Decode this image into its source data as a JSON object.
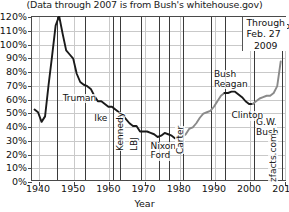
{
  "caption": "(Data through 2007 is from Bush's whitehouse.gov)",
  "watermark": "zfacts.com",
  "through_note": {
    "line1": "Through",
    "line2": "Feb. 27",
    "line3": "2009"
  },
  "chart_data": {
    "type": "line",
    "title": "",
    "subtitle": "(Data through 2007 is from Bush's whitehouse.gov)",
    "xlabel": "Year",
    "ylabel": "",
    "xlim": [
      1938,
      2010.5
    ],
    "ylim": [
      0,
      120
    ],
    "grid": true,
    "legend": "none",
    "ytick_labels": [
      "0%",
      "10%",
      "20%",
      "30%",
      "40%",
      "50%",
      "60%",
      "70%",
      "80%",
      "90%",
      "100%",
      "110%",
      "120%"
    ],
    "ytick_values": [
      0,
      10,
      20,
      30,
      40,
      50,
      60,
      70,
      80,
      90,
      100,
      110,
      120
    ],
    "xtick_labels": [
      "1940",
      "1950",
      "1960",
      "1970",
      "1980",
      "1990",
      "2000",
      "2010"
    ],
    "xtick_values": [
      1940,
      1950,
      1960,
      1970,
      1980,
      1990,
      2000,
      2010
    ],
    "series": [
      {
        "name": "Gross federal debt as percent of GDP",
        "color": "#1a1a1a",
        "x": [
          1939,
          1940,
          1941,
          1942,
          1943,
          1944,
          1945,
          1946,
          1947,
          1948,
          1949,
          1950,
          1951,
          1952,
          1953,
          1954,
          1955,
          1956,
          1957,
          1958,
          1959,
          1960,
          1961,
          1962,
          1963,
          1964,
          1965,
          1966,
          1967,
          1968,
          1969,
          1970,
          1971,
          1972,
          1973,
          1974,
          1975,
          1976,
          1977,
          1978,
          1979,
          1980,
          1981,
          1982,
          1983,
          1984,
          1985,
          1986,
          1987,
          1988,
          1989,
          1990,
          1991,
          1992,
          1993,
          1994,
          1995,
          1996,
          1997,
          1998,
          1999,
          2000,
          2001,
          2002,
          2003,
          2004,
          2005,
          2006,
          2007,
          2008,
          2009
        ],
        "values": [
          52,
          50,
          43,
          47,
          70,
          91,
          113,
          120,
          107,
          95,
          92,
          89,
          78,
          72,
          70,
          69,
          67,
          62,
          58,
          58,
          56,
          54,
          54,
          52,
          50,
          48,
          45,
          42,
          40,
          40,
          36,
          36,
          36,
          35,
          34,
          32,
          33,
          35,
          34,
          33,
          31,
          32,
          32,
          34,
          38,
          39,
          42,
          46,
          49,
          50,
          51,
          54,
          58,
          62,
          64,
          64,
          65,
          65,
          63,
          61,
          58,
          56,
          56,
          58,
          60,
          61,
          62,
          62,
          64,
          69,
          87
        ],
        "segments": [
          {
            "label": "pre-Reagan",
            "color": "#1a1a1a",
            "from": 1939,
            "to": 1981
          },
          {
            "label": "Reagan-Bush",
            "color": "#8a8a8a",
            "from": 1981,
            "to": 1993
          },
          {
            "label": "Clinton",
            "color": "#1a1a1a",
            "from": 1993,
            "to": 2001
          },
          {
            "label": "G.W. Bush-Obama",
            "color": "#8a8a8a",
            "from": 2001,
            "to": 2009
          }
        ]
      }
    ],
    "annotations": [
      {
        "text": "Truman",
        "year": 1947,
        "value": 60,
        "orient": "h"
      },
      {
        "text": "Ike",
        "year": 1956,
        "value": 45,
        "orient": "h"
      },
      {
        "text": "Kennedy",
        "year": 1962,
        "value": 22,
        "orient": "v"
      },
      {
        "text": "LBJ",
        "year": 1966,
        "value": 22,
        "orient": "v"
      },
      {
        "text": "Nixon",
        "year": 1972,
        "value": 25,
        "orient": "h"
      },
      {
        "text": "Ford",
        "year": 1972,
        "value": 18,
        "orient": "h"
      },
      {
        "text": "Carter",
        "year": 1979,
        "value": 20,
        "orient": "v"
      },
      {
        "text": "Bush",
        "year": 1990,
        "value": 77,
        "orient": "h"
      },
      {
        "text": "Reagan",
        "year": 1990,
        "value": 70,
        "orient": "h"
      },
      {
        "text": "Clinton",
        "year": 1995,
        "value": 47,
        "orient": "h"
      },
      {
        "text": "G.W.",
        "year": 2002,
        "value": 42,
        "orient": "h"
      },
      {
        "text": "Bush",
        "year": 2002,
        "value": 35,
        "orient": "h"
      },
      {
        "text": "Obama",
        "year": 2008,
        "value": 112,
        "orient": "h"
      }
    ],
    "president_dividers": [
      1945,
      1953,
      1961,
      1963,
      1969,
      1974,
      1977,
      1981,
      1989,
      1993,
      2001,
      2009
    ]
  }
}
